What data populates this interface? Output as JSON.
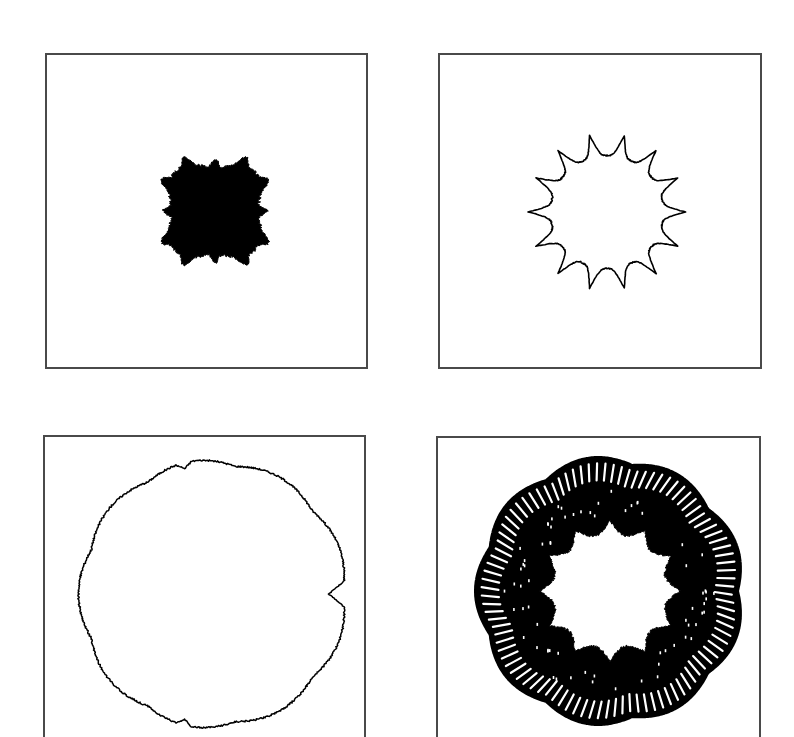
{
  "figure": {
    "background": "#ffffff",
    "frame_color": "#4a4a4a",
    "ink_color": "#000000",
    "panels": [
      {
        "id": "top-left",
        "kind": "filled-blob",
        "box": {
          "x": 45,
          "y": 53,
          "w": 323,
          "h": 316,
          "cropped_bottom": false
        },
        "shape": {
          "cx": 215,
          "cy": 211,
          "r": 46,
          "amp": 10,
          "lobes": 12,
          "square": 0.35,
          "jag": 3
        }
      },
      {
        "id": "top-right",
        "kind": "outline-star",
        "box": {
          "x": 438,
          "y": 53,
          "w": 324,
          "h": 316,
          "cropped_bottom": false
        },
        "shape": {
          "cx": 607,
          "cy": 212,
          "r": 62,
          "amp": 11,
          "lobes": 14,
          "stroke": 1.6
        }
      },
      {
        "id": "bottom-left",
        "kind": "outline-wavy-circle",
        "box": {
          "x": 43,
          "y": 435,
          "w": 323,
          "h": 302,
          "cropped_bottom": true
        },
        "shape": {
          "cx": 213,
          "cy": 594,
          "r": 132,
          "amp": 5,
          "lobes": 9,
          "jag": 1.6,
          "notch_angle": 0,
          "notch_depth": 14,
          "stroke": 1.5
        }
      },
      {
        "id": "bottom-right",
        "kind": "ring",
        "box": {
          "x": 436,
          "y": 436,
          "w": 325,
          "h": 301,
          "cropped_bottom": true
        },
        "shape": {
          "cx": 610,
          "cy": 591,
          "outer_r": 128,
          "outer_amp": 7,
          "outer_lobes": 9,
          "inner_r": 62,
          "inner_amp": 8,
          "inner_lobes": 12,
          "spokes": 96
        }
      }
    ]
  }
}
